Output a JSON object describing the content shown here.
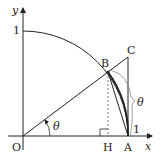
{
  "labels": {
    "y_axis": "y",
    "x_axis": "x",
    "y_one": "1",
    "origin": "O",
    "point_B": "B",
    "point_C": "C",
    "point_H": "H",
    "point_A": "A",
    "angle_O": "θ",
    "arc_angle": "θ",
    "arc_length": "1"
  },
  "colors": {
    "stroke": "#222222",
    "dashed": "#555555",
    "brace": "#888888"
  }
}
